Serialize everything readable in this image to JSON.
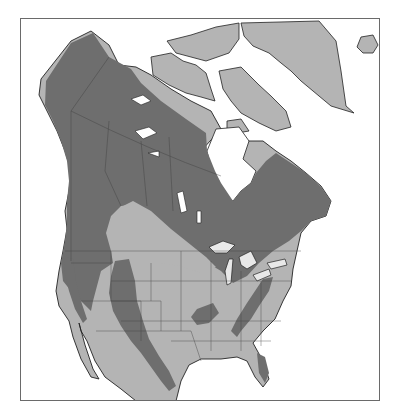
{
  "map": {
    "region": "North America",
    "legend": [],
    "colors": {
      "water": "#ffffff",
      "land_outside_range": "#b4b4b4",
      "range": "#6e6e6e",
      "coastline": "#222222",
      "boundaries": "#3c3c3c",
      "frame": "#6a6a6a"
    },
    "layers": [
      "coastline",
      "state-province-boundaries",
      "species-range"
    ]
  }
}
